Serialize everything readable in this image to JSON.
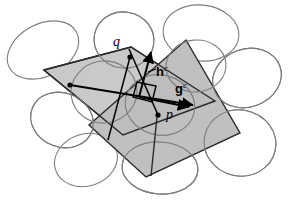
{
  "figure": {
    "background_color": "#ffffff",
    "width": 291,
    "height": 208
  },
  "labels": {
    "point_q": "q",
    "point_p": "p",
    "vector_h_base": "h",
    "vector_h_sup": "c",
    "vector_g_base": "g",
    "vector_g_sup": "c"
  },
  "colors": {
    "patch_fill": "#c9c9c9",
    "patch_fill_secondary": "#bdbdbd",
    "patch_stroke": "#2a2a2a",
    "ellipse_stroke": "#7d7d7d",
    "vector_stroke": "#000000",
    "background": "#ffffff"
  },
  "geometry": {
    "patch_a_points": "44,70 131,47 215,101 123,135",
    "patch_b_points": "186,40 240,133 146,177 89,125",
    "ellipses": [
      {
        "cx": 43,
        "cy": 50,
        "rx": 38,
        "ry": 26,
        "rot": -28
      },
      {
        "cx": 124,
        "cy": 40,
        "rx": 30,
        "ry": 28,
        "rot": 10
      },
      {
        "cx": 201,
        "cy": 33,
        "rx": 38,
        "ry": 28,
        "rot": 6
      },
      {
        "cx": 247,
        "cy": 78,
        "rx": 35,
        "ry": 29,
        "rot": -20
      },
      {
        "cx": 240,
        "cy": 143,
        "rx": 36,
        "ry": 33,
        "rot": 12
      },
      {
        "cx": 160,
        "cy": 168,
        "rx": 38,
        "ry": 26,
        "rot": 4
      },
      {
        "cx": 86,
        "cy": 160,
        "rx": 32,
        "ry": 26,
        "rot": -18
      },
      {
        "cx": 62,
        "cy": 120,
        "rx": 32,
        "ry": 27,
        "rot": 22
      },
      {
        "cx": 104,
        "cy": 92,
        "rx": 33,
        "ry": 31,
        "rot": -8
      },
      {
        "cx": 160,
        "cy": 105,
        "rx": 35,
        "ry": 30,
        "rot": 14
      },
      {
        "cx": 196,
        "cy": 66,
        "rx": 30,
        "ry": 26,
        "rot": -6
      }
    ],
    "point_q_xy": [
      130,
      57
    ],
    "point_p_xy": [
      158,
      115
    ],
    "vector_h_from": [
      141,
      95
    ],
    "vector_h_to": [
      151,
      55
    ],
    "vector_g_from": [
      141,
      95
    ],
    "vector_g_to": [
      190,
      103
    ],
    "left_anchor_xy": [
      70,
      85
    ],
    "right_angle_marker": "136,80 157,84 153,100 133,95"
  }
}
